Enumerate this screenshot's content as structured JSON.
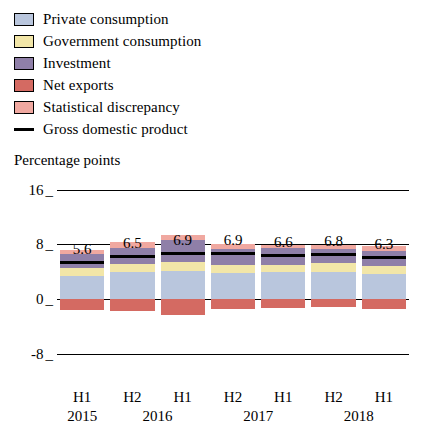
{
  "legend": {
    "items": [
      {
        "label": "Private consumption",
        "color": "#b9c6dd",
        "type": "box"
      },
      {
        "label": "Government consumption",
        "color": "#f2e6a8",
        "type": "box"
      },
      {
        "label": "Investment",
        "color": "#8f7fa8",
        "type": "box"
      },
      {
        "label": "Net exports",
        "color": "#d46a62",
        "type": "box"
      },
      {
        "label": "Statistical discrepancy",
        "color": "#f0a8a0",
        "type": "box"
      },
      {
        "label": "Gross domestic product",
        "color": "#000000",
        "type": "line"
      }
    ]
  },
  "chart_data": {
    "type": "bar",
    "title": "",
    "ylabel": "Percentage points",
    "xlabel": "",
    "ylim": [
      -12,
      18
    ],
    "yticks": [
      16,
      8,
      0,
      -8
    ],
    "grid": true,
    "stacked": true,
    "legend_position": "top",
    "categories": [
      "H1",
      "H2",
      "H1",
      "H2",
      "H1",
      "H2",
      "H1"
    ],
    "period_labels": [
      "2015",
      "2016",
      "2017",
      "2018"
    ],
    "period_spans": [
      1,
      2,
      2,
      2
    ],
    "series": [
      {
        "name": "Private consumption",
        "color": "#b9c6dd",
        "values": [
          3.4,
          3.9,
          4.1,
          3.8,
          3.9,
          4.0,
          3.7
        ]
      },
      {
        "name": "Government consumption",
        "color": "#f2e6a8",
        "values": [
          1.1,
          1.2,
          1.3,
          1.2,
          1.1,
          1.2,
          1.1
        ]
      },
      {
        "name": "Investment",
        "color": "#8f7fa8",
        "values": [
          2.1,
          2.4,
          3.2,
          2.3,
          2.5,
          2.1,
          2.2
        ]
      },
      {
        "name": "Net exports",
        "color": "#d46a62",
        "values": [
          -1.6,
          -1.8,
          -2.4,
          -1.4,
          -1.3,
          -1.1,
          -1.4
        ]
      },
      {
        "name": "Statistical discrepancy",
        "color": "#f0a8a0",
        "values": [
          0.6,
          0.8,
          0.7,
          0.7,
          0.4,
          0.6,
          0.7
        ]
      }
    ],
    "gdp_line": {
      "name": "Gross domestic product",
      "color": "#000000",
      "values": [
        5.6,
        6.5,
        6.9,
        6.9,
        6.6,
        6.8,
        6.3
      ]
    },
    "value_labels": [
      "5.6",
      "6.5",
      "6.9",
      "6.9",
      "6.6",
      "6.8",
      "6.3"
    ]
  }
}
